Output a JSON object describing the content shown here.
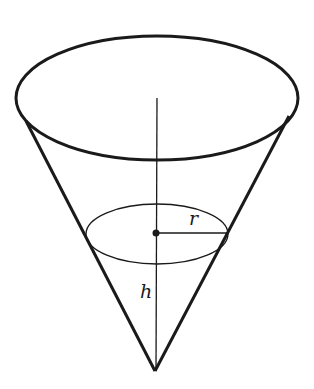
{
  "diagram": {
    "type": "cone",
    "labels": {
      "radius": "r",
      "height": "h"
    },
    "colors": {
      "stroke": "#1a1a1a",
      "background": "#ffffff"
    }
  }
}
